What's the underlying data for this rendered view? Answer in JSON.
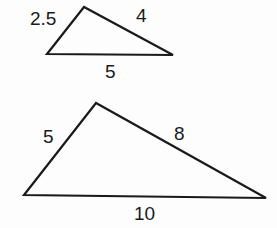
{
  "figure": {
    "stroke_color": "#1a1a1a",
    "background": "#fdfdfd",
    "triangles": [
      {
        "name": "small-triangle",
        "vertices": [
          [
            84,
            7
          ],
          [
            47,
            54
          ],
          [
            173,
            55
          ]
        ],
        "labels": {
          "left_side": "2.5",
          "right_side": "4",
          "base": "5"
        }
      },
      {
        "name": "large-triangle",
        "vertices": [
          [
            96,
            103
          ],
          [
            24,
            195
          ],
          [
            266,
            198
          ]
        ],
        "labels": {
          "left_side": "5",
          "right_side": "8",
          "base": "10"
        }
      }
    ]
  }
}
